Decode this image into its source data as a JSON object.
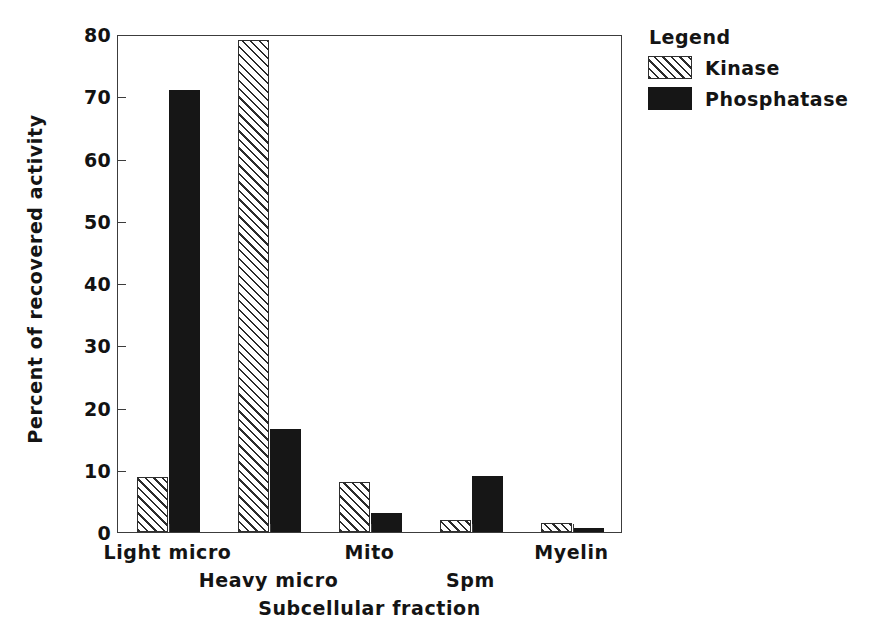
{
  "chart_data": {
    "type": "bar",
    "title": "",
    "xlabel": "Subcellular fraction",
    "ylabel": "Percent of recovered activity",
    "ylim": [
      0,
      80
    ],
    "yticks": [
      0,
      10,
      20,
      30,
      40,
      50,
      60,
      70,
      80
    ],
    "ytick_labels": [
      "0",
      "10",
      "20",
      "30",
      "40",
      "50",
      "60",
      "70",
      "80"
    ],
    "grid": false,
    "legend_position": "outside-right-top",
    "legend_title": "Legend",
    "categories": [
      "Light micro",
      "Heavy micro",
      "Mito",
      "Spm",
      "Myelin"
    ],
    "series": [
      {
        "name": "Kinase",
        "fill": "hatched-diagonal",
        "color": "#ffffff",
        "values": [
          8.8,
          79.0,
          8.0,
          2.0,
          1.5
        ]
      },
      {
        "name": "Phosphatase",
        "fill": "solid",
        "color": "#161616",
        "values": [
          71.0,
          16.5,
          3.0,
          9.0,
          0.7
        ]
      }
    ]
  },
  "axis": {
    "y_title": "Percent of recovered activity",
    "x_title": "Subcellular fraction"
  },
  "legend": {
    "title": "Legend",
    "entries": [
      {
        "label": "Kinase",
        "swatch": "hatched-diagonal-swatch"
      },
      {
        "label": "Phosphatase",
        "swatch": "solid-black-swatch"
      }
    ]
  }
}
